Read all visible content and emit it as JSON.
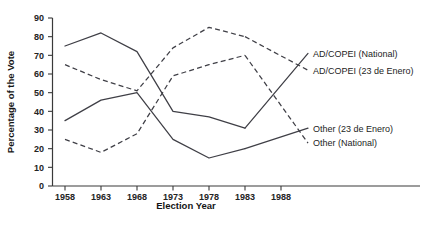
{
  "chart_data": {
    "type": "line",
    "title": "",
    "xlabel": "Election Year",
    "ylabel": "Percentage of the Vote",
    "categories": [
      1958,
      1963,
      1968,
      1973,
      1978,
      1983
    ],
    "x": [
      1958,
      1963,
      1968,
      1973,
      1978,
      1983
    ],
    "xticklabels": [
      "1958",
      "1963",
      "1968",
      "1973",
      "1978",
      "1983",
      "1988"
    ],
    "xticks": [
      1958,
      1963,
      1968,
      1973,
      1978,
      1983,
      1988
    ],
    "yticklabels": [
      "0",
      "10",
      "20",
      "30",
      "40",
      "50",
      "60",
      "70",
      "80",
      "90"
    ],
    "yticks": [
      0,
      10,
      20,
      30,
      40,
      50,
      60,
      70,
      80,
      90
    ],
    "xlim": [
      1956,
      1990
    ],
    "ylim": [
      0,
      90
    ],
    "grid": false,
    "legend_position": "right-inline-labels",
    "series": [
      {
        "name": "AD/COPEI (National)",
        "style": "solid",
        "color": "#3f3f46",
        "values": [
          75,
          82,
          72,
          40,
          37,
          31
        ],
        "label_anchor_value": 71
      },
      {
        "name": "AD/COPEI (23 de Enero)",
        "style": "dashed",
        "color": "#3f3f46",
        "values": [
          65,
          57,
          51,
          74,
          85,
          80
        ],
        "label_anchor_value": 62
      },
      {
        "name": "Other (23 de Enero)",
        "style": "solid",
        "color": "#3f3f46",
        "values": [
          35,
          46,
          50,
          25,
          15,
          20
        ],
        "label_anchor_value": 31
      },
      {
        "name": "Other (National)",
        "style": "dashed",
        "color": "#3f3f46",
        "values": [
          25,
          18,
          28,
          59,
          65,
          70
        ],
        "label_anchor_value": 23
      }
    ]
  },
  "axis": {
    "xlabel": "Election Year",
    "ylabel": "Percentage of the Vote"
  },
  "legend": {
    "items": [
      {
        "label": "AD/COPEI (National)"
      },
      {
        "label": "AD/COPEI (23 de Enero)"
      },
      {
        "label": "Other (23 de Enero)"
      },
      {
        "label": "Other (National)"
      }
    ]
  }
}
